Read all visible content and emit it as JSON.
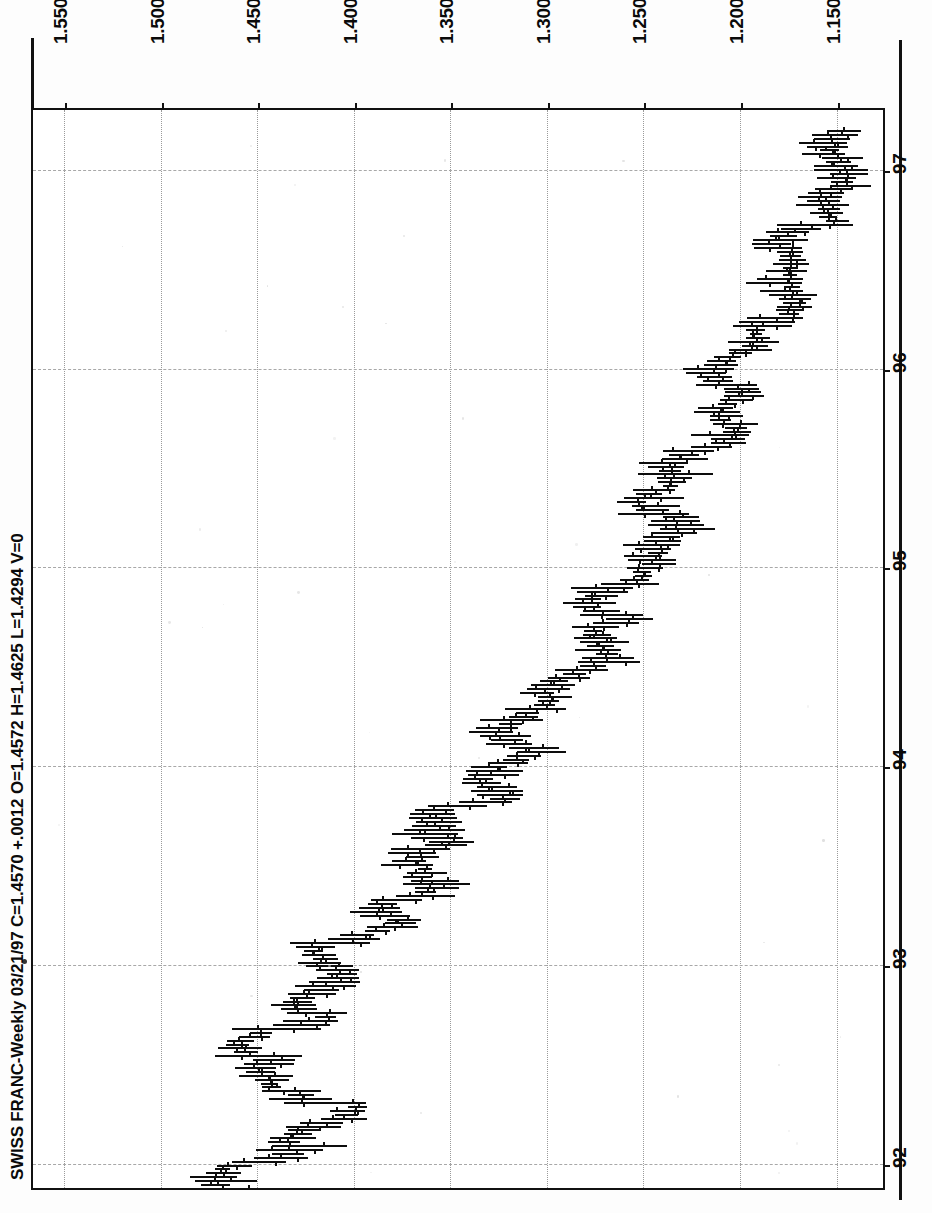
{
  "title_line": "SWISS FRANC-Weekly  03/21/97  C=1.4570  +.0012  O=1.4572  H=1.4625  L=1.4294  V=0",
  "quote": {
    "symbol": "SWISS FRANC",
    "interval": "Weekly",
    "date": "03/21/97",
    "close_label": "C=1.4570",
    "change_label": "+.0012",
    "open_label": "O=1.4572",
    "high_label": "H=1.4625",
    "low_label": "L=1.4294",
    "volume_label": "V=0"
  },
  "colors": {
    "ink": "#0d0d0d",
    "grid": "#9a9a9a",
    "paper": "#ffffff"
  },
  "chart_data": {
    "type": "line",
    "subtype": "ohlc-bar",
    "orientation": "rotated-90-ccw",
    "title": "SWISS FRANC-Weekly  03/21/97  C=1.4570  +.0012  O=1.4572  H=1.4625  L=1.4294  V=0",
    "xlabel": "",
    "ylabel": "",
    "grid": true,
    "legend": "none",
    "price_axis": {
      "position": "top",
      "ticks": [
        "1.5500",
        "1.5000",
        "1.4500",
        "1.4000",
        "1.3500",
        "1.3000",
        "1.2500",
        "1.2000",
        "1.1500"
      ],
      "values": [
        1.55,
        1.5,
        1.45,
        1.4,
        1.35,
        1.3,
        1.25,
        1.2,
        1.15
      ],
      "lim": [
        1.566,
        1.126
      ],
      "direction": "decreasing-left-to-right"
    },
    "time_axis": {
      "position": "right",
      "ticks": [
        "92",
        "93",
        "94",
        "95",
        "96",
        "97"
      ],
      "values": [
        1992,
        1993,
        1994,
        1995,
        1996,
        1997
      ],
      "lim": [
        1991.88,
        1997.3
      ],
      "direction": "increasing-bottom-to-top"
    },
    "series_name": "Swiss Franc weekly OHLC",
    "bars": [
      [
        1.452,
        1.466,
        1.44,
        1.458
      ],
      [
        1.458,
        1.47,
        1.442,
        1.445
      ],
      [
        1.445,
        1.456,
        1.425,
        1.43
      ],
      [
        1.43,
        1.44,
        1.415,
        1.422
      ],
      [
        1.422,
        1.438,
        1.418,
        1.435
      ],
      [
        1.435,
        1.452,
        1.43,
        1.448
      ],
      [
        1.448,
        1.462,
        1.44,
        1.441
      ],
      [
        1.441,
        1.45,
        1.418,
        1.424
      ],
      [
        1.424,
        1.432,
        1.402,
        1.408
      ],
      [
        1.408,
        1.415,
        1.388,
        1.393
      ],
      [
        1.393,
        1.4,
        1.376,
        1.382
      ],
      [
        1.382,
        1.39,
        1.368,
        1.374
      ],
      [
        1.374,
        1.382,
        1.36,
        1.365
      ],
      [
        1.365,
        1.372,
        1.348,
        1.352
      ],
      [
        1.352,
        1.36,
        1.336,
        1.342
      ],
      [
        1.342,
        1.35,
        1.328,
        1.333
      ],
      [
        1.333,
        1.34,
        1.318,
        1.324
      ],
      [
        1.324,
        1.33,
        1.306,
        1.311
      ],
      [
        1.311,
        1.318,
        1.294,
        1.299
      ],
      [
        1.299,
        1.306,
        1.282,
        1.288
      ],
      [
        1.288,
        1.295,
        1.27,
        1.276
      ],
      [
        1.276,
        1.284,
        1.26,
        1.266
      ],
      [
        1.266,
        1.274,
        1.252,
        1.258
      ],
      [
        1.258,
        1.266,
        1.246,
        1.252
      ],
      [
        1.252,
        1.26,
        1.24,
        1.246
      ],
      [
        1.246,
        1.254,
        1.234,
        1.24
      ],
      [
        1.24,
        1.248,
        1.226,
        1.232
      ],
      [
        1.232,
        1.24,
        1.218,
        1.224
      ],
      [
        1.224,
        1.232,
        1.21,
        1.216
      ],
      [
        1.216,
        1.224,
        1.204,
        1.21
      ],
      [
        1.21,
        1.218,
        1.196,
        1.202
      ],
      [
        1.202,
        1.21,
        1.188,
        1.194
      ],
      [
        1.194,
        1.202,
        1.18,
        1.186
      ],
      [
        1.186,
        1.194,
        1.174,
        1.18
      ],
      [
        1.18,
        1.188,
        1.166,
        1.172
      ],
      [
        1.172,
        1.18,
        1.16,
        1.166
      ],
      [
        1.166,
        1.174,
        1.154,
        1.16
      ],
      [
        1.16,
        1.168,
        1.148,
        1.154
      ],
      [
        1.154,
        1.162,
        1.142,
        1.148
      ],
      [
        1.148,
        1.156,
        1.136,
        1.142
      ]
    ],
    "annotations": [
      {
        "text": "1992 low region near 1.4800",
        "year": 1992.0,
        "price": 1.48
      },
      {
        "text": "1995 spike high near 1.1300",
        "year": 1995.1,
        "price": 1.13
      },
      {
        "text": "1997 close 1.4570",
        "year": 1997.2,
        "price": 1.457
      }
    ]
  }
}
